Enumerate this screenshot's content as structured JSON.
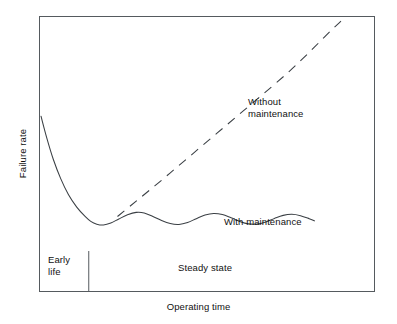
{
  "figure": {
    "width": 397,
    "height": 324,
    "background": "#ffffff",
    "line_color": "#3a3f44",
    "frame_color": "#555a5e",
    "text_color": "#111111"
  },
  "axes": {
    "ylabel": "Failure rate",
    "xlabel": "Operating time"
  },
  "annotations": {
    "without_maintenance": "Without\nmaintenance",
    "with_maintenance": "With maintenance",
    "early_life": "Early\nlife",
    "steady_state": "Steady state"
  },
  "chart_data": {
    "type": "line",
    "title": "",
    "xlabel": "Operating time",
    "ylabel": "Failure rate",
    "xlim": [
      0,
      1
    ],
    "ylim": [
      0,
      1
    ],
    "grid": false,
    "axis_ticks": false,
    "legend": "inline-annotations",
    "regions": [
      {
        "name": "Early life",
        "x_start": 0.0,
        "x_end": 0.146,
        "label": "Early\nlife"
      },
      {
        "name": "Steady state",
        "x_start": 0.146,
        "x_end": 1.0,
        "label": "Steady state"
      }
    ],
    "region_divider_x": 0.146,
    "series": [
      {
        "name": "With maintenance",
        "style": "solid",
        "description": "Bathtub curve: steep early-life decay followed by an oscillating steady-state plateau",
        "points": [
          [
            0.003,
            0.638
          ],
          [
            0.02,
            0.56
          ],
          [
            0.04,
            0.48
          ],
          [
            0.062,
            0.41
          ],
          [
            0.085,
            0.352
          ],
          [
            0.11,
            0.306
          ],
          [
            0.135,
            0.272
          ],
          [
            0.152,
            0.254
          ],
          [
            0.17,
            0.244
          ],
          [
            0.19,
            0.241
          ],
          [
            0.212,
            0.248
          ],
          [
            0.236,
            0.263
          ],
          [
            0.262,
            0.278
          ],
          [
            0.288,
            0.287
          ],
          [
            0.312,
            0.285
          ],
          [
            0.338,
            0.272
          ],
          [
            0.364,
            0.257
          ],
          [
            0.39,
            0.246
          ],
          [
            0.416,
            0.243
          ],
          [
            0.442,
            0.25
          ],
          [
            0.468,
            0.264
          ],
          [
            0.494,
            0.277
          ],
          [
            0.52,
            0.283
          ],
          [
            0.546,
            0.279
          ],
          [
            0.572,
            0.267
          ],
          [
            0.598,
            0.254
          ],
          [
            0.624,
            0.245
          ],
          [
            0.65,
            0.244
          ],
          [
            0.676,
            0.252
          ],
          [
            0.702,
            0.265
          ],
          [
            0.728,
            0.276
          ],
          [
            0.754,
            0.28
          ],
          [
            0.78,
            0.275
          ],
          [
            0.806,
            0.264
          ],
          [
            0.822,
            0.256
          ]
        ]
      },
      {
        "name": "Without maintenance",
        "style": "dashed",
        "description": "Monotonically increasing wear-out curve diverging upward from the steady-state plateau",
        "points": [
          [
            0.232,
            0.272
          ],
          [
            0.29,
            0.33
          ],
          [
            0.35,
            0.39
          ],
          [
            0.41,
            0.452
          ],
          [
            0.47,
            0.514
          ],
          [
            0.53,
            0.576
          ],
          [
            0.59,
            0.638
          ],
          [
            0.65,
            0.7
          ],
          [
            0.7,
            0.752
          ],
          [
            0.745,
            0.8
          ],
          [
            0.785,
            0.846
          ],
          [
            0.82,
            0.888
          ],
          [
            0.85,
            0.925
          ],
          [
            0.875,
            0.955
          ],
          [
            0.895,
            0.978
          ],
          [
            0.915,
            1.0
          ]
        ]
      }
    ]
  }
}
